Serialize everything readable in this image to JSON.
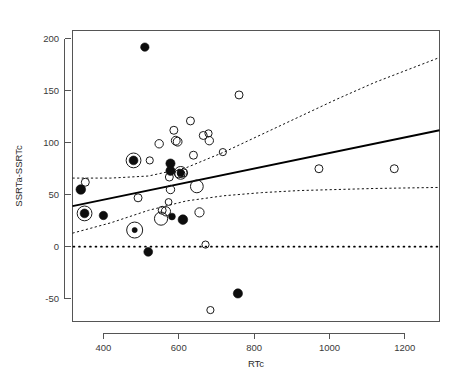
{
  "figure": {
    "title": "",
    "background_color": "#ffffff",
    "width": 467,
    "height": 390
  },
  "axes": {
    "x_title": "RTc",
    "y_title": "SSRTa-SSRTc",
    "x_ticks": [
      "400",
      "600",
      "800",
      "1000",
      "1200"
    ],
    "y_ticks": [
      "200",
      "150",
      "100",
      "50",
      "0",
      "-50"
    ]
  },
  "chart_data": {
    "type": "scatter",
    "title": "",
    "xlabel": "RTc",
    "ylabel": "SSRTa-SSRTc",
    "xlim": [
      318,
      1292
    ],
    "ylim": [
      -72,
      208
    ],
    "x_ticks": [
      400,
      600,
      800,
      1000,
      1200
    ],
    "y_ticks": [
      -50,
      0,
      50,
      100,
      150,
      200
    ],
    "grid": false,
    "legend": "none",
    "series": [
      {
        "name": "open circle points",
        "marker": "open-circle",
        "points": [
          {
            "x": 352,
            "y": 62,
            "r": 4.0
          },
          {
            "x": 492,
            "y": 47,
            "r": 4.0
          },
          {
            "x": 523,
            "y": 83,
            "r": 3.6
          },
          {
            "x": 548,
            "y": 99,
            "r": 4.2
          },
          {
            "x": 556,
            "y": 35,
            "r": 4.0
          },
          {
            "x": 566,
            "y": 34,
            "r": 4.6
          },
          {
            "x": 573,
            "y": 43,
            "r": 3.4
          },
          {
            "x": 575,
            "y": 67,
            "r": 4.0
          },
          {
            "x": 578,
            "y": 55,
            "r": 4.2
          },
          {
            "x": 587,
            "y": 112,
            "r": 4.0
          },
          {
            "x": 592,
            "y": 102,
            "r": 4.4
          },
          {
            "x": 597,
            "y": 101,
            "r": 4.4
          },
          {
            "x": 600,
            "y": 70,
            "r": 4.0
          },
          {
            "x": 607,
            "y": 70,
            "r": 3.6
          },
          {
            "x": 613,
            "y": 71,
            "r": 4.0
          },
          {
            "x": 631,
            "y": 121,
            "r": 4.0
          },
          {
            "x": 639,
            "y": 88,
            "r": 4.0
          },
          {
            "x": 648,
            "y": 58,
            "r": 6.4
          },
          {
            "x": 655,
            "y": 33,
            "r": 4.6
          },
          {
            "x": 665,
            "y": 107,
            "r": 4.0
          },
          {
            "x": 671,
            "y": 2,
            "r": 3.6
          },
          {
            "x": 679,
            "y": 109,
            "r": 3.6
          },
          {
            "x": 681,
            "y": 102,
            "r": 4.2
          },
          {
            "x": 684,
            "y": -61,
            "r": 3.6
          },
          {
            "x": 717,
            "y": 91,
            "r": 3.6
          },
          {
            "x": 760,
            "y": 146,
            "r": 4.0
          },
          {
            "x": 972,
            "y": 75,
            "r": 4.0
          },
          {
            "x": 1172,
            "y": 75,
            "r": 4.0
          }
        ]
      },
      {
        "name": "filled circle points",
        "marker": "filled-circle",
        "points": [
          {
            "x": 340,
            "y": 55,
            "r": 4.8
          },
          {
            "x": 350,
            "y": 32,
            "r": 4.4
          },
          {
            "x": 400,
            "y": 30,
            "r": 4.2
          },
          {
            "x": 480,
            "y": 83,
            "r": 4.4
          },
          {
            "x": 483,
            "y": 16,
            "r": 2.6
          },
          {
            "x": 510,
            "y": 192,
            "r": 4.2
          },
          {
            "x": 519,
            "y": -5,
            "r": 4.4
          },
          {
            "x": 578,
            "y": 80,
            "r": 4.6
          },
          {
            "x": 578,
            "y": 73,
            "r": 4.6
          },
          {
            "x": 582,
            "y": 29,
            "r": 3.4
          },
          {
            "x": 605,
            "y": 71,
            "r": 3.6
          },
          {
            "x": 611,
            "y": 26,
            "r": 4.8
          },
          {
            "x": 757,
            "y": -45,
            "r": 4.6
          }
        ]
      },
      {
        "name": "highlighted points (outer ring)",
        "marker": "ring",
        "points": [
          {
            "x": 350,
            "y": 32,
            "r": 7.4
          },
          {
            "x": 480,
            "y": 83,
            "r": 7.4
          },
          {
            "x": 483,
            "y": 16,
            "r": 8.0
          },
          {
            "x": 553,
            "y": 27,
            "r": 6.6
          },
          {
            "x": 605,
            "y": 71,
            "r": 6.4
          }
        ]
      }
    ],
    "fit_line": {
      "name": "regression line",
      "style": "solid",
      "x_start": 318,
      "y_start": 39,
      "x_end": 1292,
      "y_end": 112
    },
    "confidence_bands": [
      {
        "name": "upper confidence band",
        "style": "dashed",
        "points": [
          {
            "x": 318,
            "y": 66
          },
          {
            "x": 420,
            "y": 66
          },
          {
            "x": 520,
            "y": 68
          },
          {
            "x": 620,
            "y": 76
          },
          {
            "x": 720,
            "y": 91
          },
          {
            "x": 820,
            "y": 108
          },
          {
            "x": 920,
            "y": 125
          },
          {
            "x": 1020,
            "y": 142
          },
          {
            "x": 1120,
            "y": 158
          },
          {
            "x": 1292,
            "y": 182
          }
        ]
      },
      {
        "name": "lower confidence band",
        "style": "dashed",
        "points": [
          {
            "x": 318,
            "y": 13
          },
          {
            "x": 420,
            "y": 23
          },
          {
            "x": 520,
            "y": 35
          },
          {
            "x": 620,
            "y": 44
          },
          {
            "x": 720,
            "y": 49
          },
          {
            "x": 820,
            "y": 52
          },
          {
            "x": 920,
            "y": 54
          },
          {
            "x": 1020,
            "y": 55
          },
          {
            "x": 1120,
            "y": 56
          },
          {
            "x": 1292,
            "y": 57
          }
        ]
      }
    ],
    "reference_line": {
      "name": "zero reference line",
      "style": "dotted",
      "y": 0
    }
  }
}
